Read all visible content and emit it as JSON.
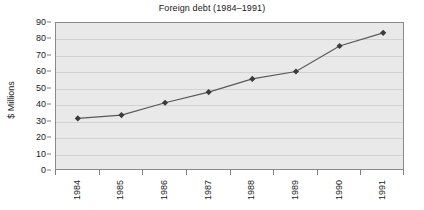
{
  "chart_data": {
    "type": "line",
    "title": "Foreign debt (1984–1991)",
    "xlabel": "",
    "ylabel": "$ Millions",
    "categories": [
      "1984",
      "1985",
      "1986",
      "1987",
      "1988",
      "1989",
      "1990",
      "1991"
    ],
    "values": [
      32,
      34,
      41.5,
      48,
      56,
      60.5,
      76,
      84
    ],
    "series": [
      {
        "name": "Foreign debt",
        "values": [
          32,
          34,
          41.5,
          48,
          56,
          60.5,
          76,
          84
        ]
      }
    ],
    "ylim": [
      0,
      90
    ],
    "ytick_step": 10,
    "yticks": [
      "90",
      "80",
      "70",
      "60",
      "50",
      "40",
      "30",
      "20",
      "10",
      "0"
    ],
    "grid": "horizontal",
    "legend": "none",
    "marker": "diamond",
    "colors": {
      "line": "#595959",
      "marker": "#3b3b3b",
      "plot_background": "#e9e9e9",
      "plot_border": "#8a8a8a",
      "gridline": "#d2d2d2",
      "page_background": "#ffffff",
      "text": "#1a1a1a"
    }
  }
}
